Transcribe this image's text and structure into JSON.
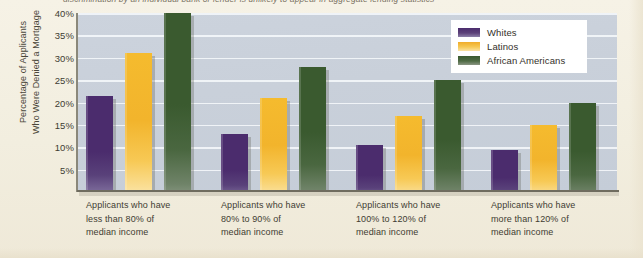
{
  "figure": {
    "caption_partial": "discrimination by an individual bank or lender is unlikely to appear in aggregate lending statistics",
    "background_color": "#f2eedf",
    "plot_background_color": "#c9d0da",
    "gridline_color": "#f3f6fa"
  },
  "chart_data": {
    "type": "bar",
    "title": "",
    "xlabel": "",
    "ylabel": "Percentage of Applicants Who Were Denied a Mortgage",
    "ylim": [
      0,
      40
    ],
    "ytick_values": [
      40,
      35,
      30,
      25,
      20,
      15,
      10,
      5
    ],
    "ytick_labels": [
      "40%",
      "35%",
      "30%",
      "25%",
      "20%",
      "15%",
      "10%",
      "5%"
    ],
    "grid": true,
    "legend_position": "top-right",
    "categories": [
      "Applicants who have less than 80% of median income",
      "Applicants who have 80% to 90% of median income",
      "Applicants who have 100% to 120% of median income",
      "Applicants who have more than 120% of median income"
    ],
    "category_lines": [
      [
        "Applicants who have",
        "less than 80% of",
        "median income"
      ],
      [
        "Applicants who have",
        "80% to 90% of",
        "median income"
      ],
      [
        "Applicants who have",
        "100% to 120% of",
        "median income"
      ],
      [
        "Applicants who have",
        "more than 120% of",
        "median income"
      ]
    ],
    "series": [
      {
        "name": "Whites",
        "color": "#4b2c6d",
        "values": [
          21.5,
          13.0,
          10.5,
          9.5
        ]
      },
      {
        "name": "Latinos",
        "color": "#f2b42c",
        "values": [
          31.0,
          21.0,
          17.0,
          15.0
        ]
      },
      {
        "name": "African Americans",
        "color": "#3a5a2f",
        "values": [
          40.0,
          28.0,
          25.0,
          20.0
        ]
      }
    ]
  },
  "y_axis": {
    "title_line1": "Percentage of Applicants",
    "title_line2": "Who Were Denied a Mortgage"
  },
  "legend": {
    "items": [
      {
        "label": "Whites"
      },
      {
        "label": "Latinos"
      },
      {
        "label": "African Americans"
      }
    ]
  }
}
